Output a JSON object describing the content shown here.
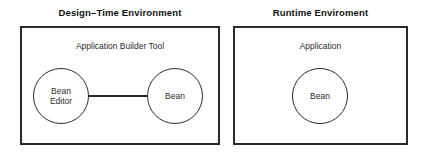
{
  "diagram": {
    "title_left": "Design–Time Environment",
    "title_right": "Runtime Enviroment",
    "left_panel": {
      "caption": "Application Builder Tool",
      "nodes": [
        {
          "label": "Bean\nEditor"
        },
        {
          "label": "Bean"
        }
      ],
      "connector": "solid-line"
    },
    "right_panel": {
      "caption": "Application",
      "nodes": [
        {
          "label": "Bean"
        }
      ]
    },
    "colors": {
      "background": "#ffffff",
      "box_border": "#2b2b2b",
      "circle_border": "#2b2b2b",
      "text": "#2b2b2b",
      "title_text": "#111111"
    }
  }
}
